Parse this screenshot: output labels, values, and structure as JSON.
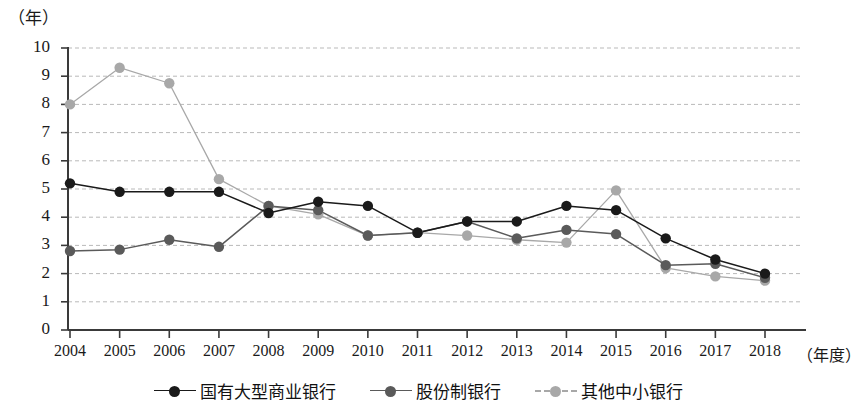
{
  "axis_unit_label": "（年）",
  "x_unit_label": "（年度）",
  "y_ticks": [
    "0",
    "1",
    "2",
    "3",
    "4",
    "5",
    "6",
    "7",
    "8",
    "9",
    "10"
  ],
  "x_ticks": [
    "2004",
    "2005",
    "2006",
    "2007",
    "2008",
    "2009",
    "2010",
    "2011",
    "2012",
    "2013",
    "2014",
    "2015",
    "2016",
    "2017",
    "2018"
  ],
  "legend": [
    {
      "label": "国有大型商业银行",
      "color": "#1a1a1a"
    },
    {
      "label": "股份制银行",
      "color": "#5a5a5a"
    },
    {
      "label": "其他中小银行",
      "color": "#a8a8a8"
    }
  ],
  "chart_data": {
    "type": "line",
    "title": "",
    "subtitle": "",
    "xlabel": "（年度）",
    "ylabel": "（年）",
    "ylim": [
      0,
      10
    ],
    "xlim": [
      "2004",
      "2018"
    ],
    "grid": true,
    "grid_axis": "y",
    "legend_position": "bottom",
    "categories": [
      "2004",
      "2005",
      "2006",
      "2007",
      "2008",
      "2009",
      "2010",
      "2011",
      "2012",
      "2013",
      "2014",
      "2015",
      "2016",
      "2017",
      "2018"
    ],
    "series": [
      {
        "name": "国有大型商业银行",
        "color": "#1a1a1a",
        "values": [
          5.2,
          4.9,
          4.9,
          4.9,
          4.15,
          4.55,
          4.4,
          3.45,
          3.85,
          3.85,
          4.4,
          4.25,
          3.25,
          2.5,
          2.0
        ]
      },
      {
        "name": "股份制银行",
        "color": "#5a5a5a",
        "values": [
          2.8,
          2.85,
          3.2,
          2.95,
          4.4,
          4.25,
          3.35,
          3.45,
          3.85,
          3.25,
          3.55,
          3.4,
          2.3,
          2.35,
          1.85
        ]
      },
      {
        "name": "其他中小银行",
        "color": "#a8a8a8",
        "values": [
          8.0,
          9.3,
          8.75,
          5.35,
          4.4,
          4.1,
          3.35,
          3.45,
          3.35,
          3.2,
          3.1,
          4.95,
          2.2,
          1.9,
          1.75
        ]
      }
    ]
  }
}
